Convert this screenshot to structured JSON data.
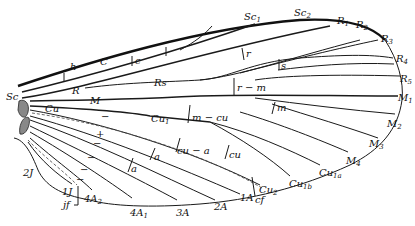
{
  "diagram": {
    "labels": {
      "C": "C",
      "h": "h",
      "Sc": "Sc",
      "Sc1": "Sc",
      "Sc1_sub": "1",
      "Sc2": "Sc",
      "Sc2_sub": "2",
      "c": "c",
      "R": "R",
      "Rs": "Rs",
      "r": "r",
      "s": "s",
      "r_m": "r − m",
      "R1": "R",
      "R1_sub": "1",
      "R2": "R",
      "R2_sub": "2",
      "R3": "R",
      "R3_sub": "3",
      "R4": "R",
      "R4_sub": "4",
      "R5": "R",
      "R5_sub": "5",
      "M": "M",
      "m": "m",
      "M1": "M",
      "M1_sub": "1",
      "M2": "M",
      "M2_sub": "2",
      "M3": "M",
      "M3_sub": "3",
      "M4": "M",
      "M4_sub": "4",
      "Cu": "Cu",
      "Cu1": "Cu",
      "Cu1_sub": "1",
      "m_cu": "m − cu",
      "cu": "cu",
      "cu_a": "cu − a",
      "Cu1a": "Cu",
      "Cu1a_sub": "1a",
      "Cu1b": "Cu",
      "Cu1b_sub": "1b",
      "Cu2": "Cu",
      "Cu2_sub": "2",
      "cf": "cf",
      "a1": "a",
      "a2": "a",
      "A1": "1A",
      "A2": "2A",
      "A3": "3A",
      "A4_1": "4A",
      "A4_1_sub": "1",
      "A4_2": "4A",
      "A4_2_sub": "2",
      "J1": "1J",
      "J2": "2J",
      "jf": "jf"
    },
    "signs": [
      "−",
      "+",
      "−",
      "−",
      "−",
      "−"
    ]
  }
}
